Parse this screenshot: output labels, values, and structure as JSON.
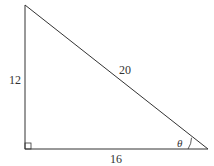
{
  "diagram": {
    "type": "right-triangle",
    "labels": {
      "left_side": "12",
      "hypotenuse": "20",
      "bottom_side": "16",
      "angle": "θ"
    },
    "right_angle_marker": "bottom-left",
    "angle_location": "bottom-right",
    "stroke_color": "#333333"
  }
}
